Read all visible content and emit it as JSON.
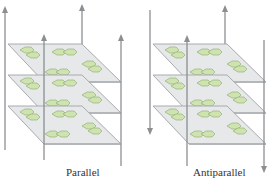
{
  "figure": {
    "type": "beta-sheet stacking diagram",
    "panels": [
      {
        "id": "parallel",
        "label": "Parallel",
        "sheet_count": 3,
        "strand_directions": [
          "up",
          "up",
          "up",
          "up"
        ]
      },
      {
        "id": "antiparallel",
        "label": "Antiparallel",
        "sheet_count": 3,
        "strand_directions": [
          "down",
          "up",
          "up",
          "down"
        ]
      }
    ],
    "colors": {
      "sheet_fill": "#e6e8ea",
      "sheet_edge": "#a8abae",
      "hexagon_fill": "#cfe3b0",
      "hexagon_edge": "#8aa86a",
      "arrow": "#8c8f92",
      "text": "#333333"
    }
  }
}
